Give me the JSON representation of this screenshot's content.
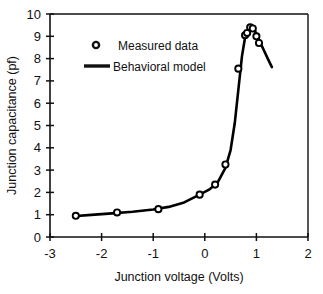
{
  "chart_data": {
    "type": "scatter",
    "title": "",
    "xlabel": "Junction voltage  (Volts)",
    "ylabel": "Junction capacitance  (pf)",
    "xlim": [
      -3,
      2
    ],
    "ylim": [
      0,
      10
    ],
    "xticks": [
      -3,
      -2,
      -1,
      0,
      1,
      2
    ],
    "xtick_labels": [
      "-3",
      "-2",
      "-1",
      "0",
      "1",
      "2"
    ],
    "yticks": [
      0,
      1,
      2,
      3,
      4,
      5,
      6,
      7,
      8,
      9,
      10
    ],
    "ytick_labels": [
      "0",
      "1",
      "2",
      "3",
      "4",
      "5",
      "6",
      "7",
      "8",
      "9",
      "10"
    ],
    "grid": false,
    "legend_position": "upper-left-inside",
    "series": [
      {
        "name": "Measured data",
        "marker": "open-circle",
        "color": "#000000",
        "points": [
          {
            "x": -2.5,
            "y": 0.95
          },
          {
            "x": -1.7,
            "y": 1.1
          },
          {
            "x": -0.9,
            "y": 1.25
          },
          {
            "x": -0.1,
            "y": 1.9
          },
          {
            "x": 0.2,
            "y": 2.35
          },
          {
            "x": 0.4,
            "y": 3.25
          },
          {
            "x": 0.65,
            "y": 7.55
          },
          {
            "x": 0.78,
            "y": 9.05
          },
          {
            "x": 0.82,
            "y": 9.15
          },
          {
            "x": 0.88,
            "y": 9.4
          },
          {
            "x": 0.93,
            "y": 9.35
          },
          {
            "x": 1.0,
            "y": 9.0
          },
          {
            "x": 1.05,
            "y": 8.7
          }
        ]
      },
      {
        "name": "Behavioral model",
        "marker": "none",
        "color": "#000000",
        "points": [
          {
            "x": -2.55,
            "y": 0.93
          },
          {
            "x": -2.2,
            "y": 0.99
          },
          {
            "x": -1.8,
            "y": 1.06
          },
          {
            "x": -1.4,
            "y": 1.13
          },
          {
            "x": -1.0,
            "y": 1.23
          },
          {
            "x": -0.7,
            "y": 1.35
          },
          {
            "x": -0.4,
            "y": 1.55
          },
          {
            "x": -0.1,
            "y": 1.9
          },
          {
            "x": 0.1,
            "y": 2.15
          },
          {
            "x": 0.25,
            "y": 2.45
          },
          {
            "x": 0.4,
            "y": 3.1
          },
          {
            "x": 0.5,
            "y": 3.9
          },
          {
            "x": 0.58,
            "y": 5.1
          },
          {
            "x": 0.65,
            "y": 6.6
          },
          {
            "x": 0.72,
            "y": 8.1
          },
          {
            "x": 0.78,
            "y": 8.95
          },
          {
            "x": 0.84,
            "y": 9.3
          },
          {
            "x": 0.9,
            "y": 9.45
          },
          {
            "x": 0.96,
            "y": 9.3
          },
          {
            "x": 1.03,
            "y": 8.95
          },
          {
            "x": 1.12,
            "y": 8.5
          },
          {
            "x": 1.22,
            "y": 8.0
          },
          {
            "x": 1.3,
            "y": 7.62
          }
        ]
      }
    ],
    "legend": [
      {
        "label": "Measured data",
        "marker": "open-circle"
      },
      {
        "label": "Behavioral model",
        "marker": "line"
      }
    ]
  }
}
